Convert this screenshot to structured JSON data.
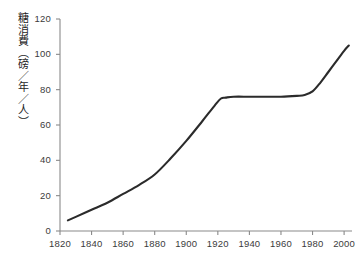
{
  "chart_data": {
    "type": "line",
    "title": "",
    "subtitle": "",
    "xlabel": "",
    "ylabel": "糖消費（磅／年／人）",
    "ylabel_translation": "Sugar consumption (pounds/year/person)",
    "xlim": [
      1820,
      2005
    ],
    "ylim": [
      0,
      120
    ],
    "grid": false,
    "legend": null,
    "x_ticks": [
      "1820",
      "1840",
      "1860",
      "1880",
      "1900",
      "1920",
      "1940",
      "1960",
      "1980",
      "2000"
    ],
    "y_ticks": [
      "0",
      "20",
      "40",
      "60",
      "80",
      "100",
      "120"
    ],
    "x": [
      1825,
      1830,
      1840,
      1850,
      1860,
      1870,
      1880,
      1890,
      1900,
      1910,
      1918,
      1922,
      1925,
      1930,
      1940,
      1950,
      1960,
      1970,
      1975,
      1980,
      1985,
      1990,
      1995,
      2000,
      2003
    ],
    "series": [
      {
        "name": "糖消費",
        "color": "#2b2b2b",
        "values": [
          6,
          8,
          12,
          16,
          21,
          26,
          32,
          41,
          51,
          62,
          71,
          75,
          75.5,
          76,
          76,
          76,
          76,
          76.5,
          77,
          79,
          84,
          90,
          96,
          102,
          105
        ]
      }
    ],
    "annotations": []
  },
  "axes": {
    "axis_color": "#8a8a8a",
    "tick_label_color": "#3b3b3b",
    "label_color": "#1e1e1e"
  }
}
